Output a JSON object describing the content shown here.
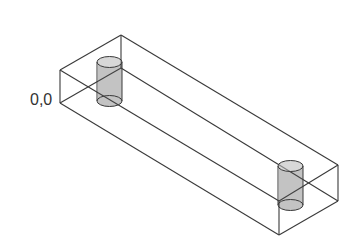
{
  "diagram": {
    "type": "isometric wireframe box with two cylinders",
    "origin_label": "0,0",
    "colors": {
      "line": "#3a3a3a",
      "hatch": "#555555",
      "background": "#ffffff"
    },
    "box": {
      "vertices": {
        "left_top": [
          60,
          70
        ],
        "left_bottom": [
          60,
          103
        ],
        "back_top": [
          121,
          35
        ],
        "back_bottom": [
          121,
          68
        ],
        "right_back_top": [
          338,
          165
        ],
        "right_back_bottom": [
          338,
          201
        ],
        "front_top": [
          279,
          201
        ],
        "front_bottom": [
          279,
          235
        ]
      }
    },
    "cylinders": [
      {
        "name": "left-cylinder",
        "cx": 109.5,
        "top_y": 62,
        "bottom_y": 101,
        "rx": 12.5,
        "ry": 5.5
      },
      {
        "name": "right-cylinder",
        "cx": 290.5,
        "top_y": 166,
        "bottom_y": 205,
        "rx": 12.5,
        "ry": 5.5
      }
    ]
  }
}
